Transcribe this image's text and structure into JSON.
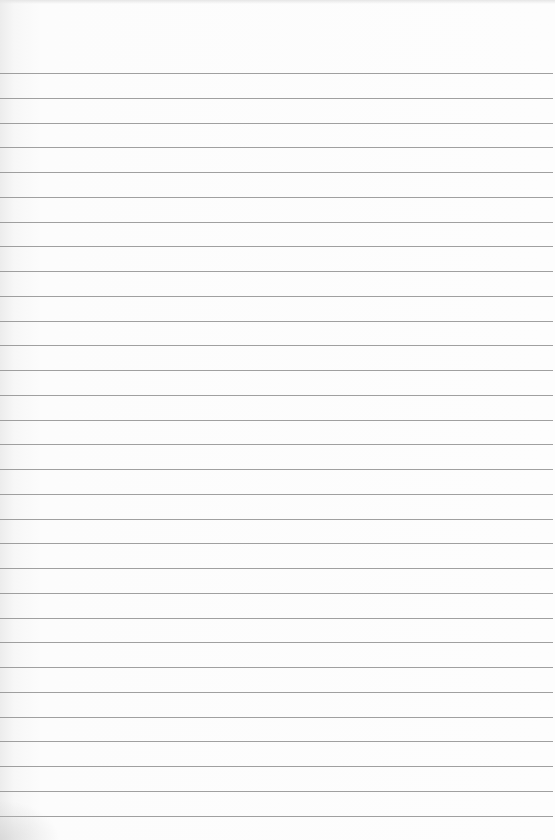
{
  "page": {
    "type": "lined-paper",
    "background_color": "#fcfcfc",
    "line_color": "#8f8f8f",
    "first_line_y": 73,
    "line_spacing": 24.75,
    "line_count": 31,
    "text": ""
  }
}
